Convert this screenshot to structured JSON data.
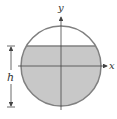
{
  "diagram": {
    "title": "",
    "axes": {
      "x_label": "x",
      "y_label": "y"
    },
    "dimension": {
      "label": "h"
    },
    "colors": {
      "circle_stroke": "#808080",
      "fill": "#c8c8c8",
      "axis": "#444444",
      "background": "#ffffff"
    }
  }
}
